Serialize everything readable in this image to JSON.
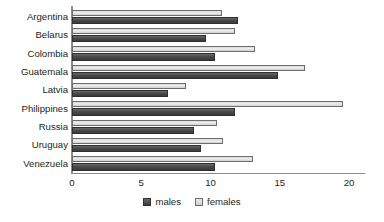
{
  "chart_data": {
    "type": "bar",
    "orientation": "horizontal",
    "title": "",
    "subtitle": "",
    "xlabel": "",
    "ylabel": "",
    "xlim": [
      0,
      20
    ],
    "xticks": [
      0,
      5,
      10,
      15,
      20
    ],
    "xtick_labels": [
      "0",
      "5",
      "10",
      "15",
      "20"
    ],
    "grid": false,
    "legend_position": "bottom-center",
    "categories": [
      "Argentina",
      "Belarus",
      "Colombia",
      "Guatemala",
      "Latvia",
      "Philippines",
      "Russia",
      "Uruguay",
      "Venezuela"
    ],
    "series": [
      {
        "name": "males",
        "color": "#4a4a4a",
        "values": [
          12.0,
          9.7,
          10.3,
          14.9,
          6.9,
          11.8,
          8.8,
          9.3,
          10.3
        ]
      },
      {
        "name": "females",
        "color": "#e3e3e3",
        "values": [
          10.8,
          11.8,
          13.2,
          16.8,
          8.2,
          19.6,
          10.5,
          10.9,
          13.1
        ]
      }
    ]
  },
  "legend": {
    "items": [
      {
        "label": "males",
        "swatch": "males-swatch"
      },
      {
        "label": "females",
        "swatch": "females-swatch"
      }
    ]
  },
  "colors": {
    "males_fill": "#4a4a4a",
    "females_fill": "#e3e3e3",
    "axis": "#8c8c8c",
    "text": "#231f20",
    "background": "#ffffff"
  }
}
